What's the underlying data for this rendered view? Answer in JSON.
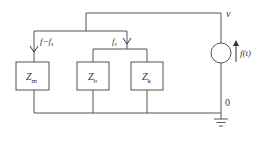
{
  "diagram": {
    "type": "circuit",
    "nodes": {
      "top": {
        "label": "v"
      },
      "bottom": {
        "label": "0"
      }
    },
    "source": {
      "label": "f(t)",
      "kind": "current-source",
      "direction": "up"
    },
    "currents": [
      {
        "id": "left",
        "label_main": "f",
        "label_sep": "−",
        "label_f2": "f",
        "label_sub": "s"
      },
      {
        "id": "right",
        "label_main": "f",
        "label_sub": "s"
      }
    ],
    "impedances": [
      {
        "id": "zm",
        "label": "Z",
        "sub": "m"
      },
      {
        "id": "zb",
        "label": "Z",
        "sub": "b"
      },
      {
        "id": "zk",
        "label": "Z",
        "sub": "k"
      }
    ],
    "colors": {
      "line": "#555555",
      "text": "#333333",
      "background": "#ffffff"
    }
  }
}
